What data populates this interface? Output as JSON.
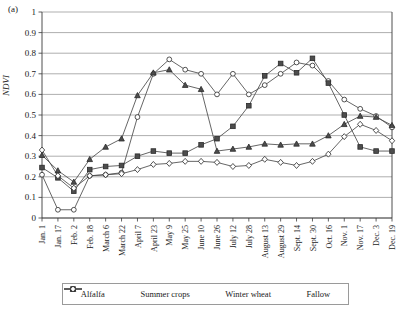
{
  "panel": {
    "label": "(a)"
  },
  "chart_data": {
    "type": "line",
    "title": "",
    "xlabel": "",
    "ylabel": "NDVI",
    "ylim": [
      0,
      1
    ],
    "yticks": [
      0,
      0.1,
      0.2,
      0.3,
      0.4,
      0.5,
      0.6,
      0.7,
      0.8,
      0.9,
      1
    ],
    "ytick_labels": [
      "0",
      "0.1",
      "0.2",
      "0.3",
      "0.4",
      "0.5",
      "0.6",
      "0.7",
      "0.8",
      "0.9",
      "1"
    ],
    "grid": true,
    "legend_position": "bottom",
    "categories": [
      "Jan. 1",
      "Jan. 17",
      "Feb. 2",
      "Feb. 18",
      "March 6",
      "March 22",
      "April 7",
      "April 23",
      "May 9",
      "May 25",
      "June 10",
      "June 26",
      "July 12",
      "July 28",
      "August 13",
      "August 29",
      "Sept. 14",
      "Sept. 30",
      "Oct. 16",
      "Nov. 1",
      "Nov. 17",
      "Dec. 3",
      "Dec. 19"
    ],
    "series": [
      {
        "name": "Alfalfa",
        "marker": "circle",
        "fill": "open",
        "values": [
          0.21,
          0.04,
          0.04,
          0.205,
          0.21,
          0.22,
          0.49,
          0.7,
          0.77,
          0.72,
          0.7,
          0.6,
          0.7,
          0.6,
          0.645,
          0.7,
          0.755,
          0.74,
          0.665,
          0.575,
          0.53,
          0.495,
          0.44
        ]
      },
      {
        "name": "Summer crops",
        "marker": "square",
        "fill": "filled",
        "values": [
          0.245,
          0.195,
          0.13,
          0.235,
          0.25,
          0.255,
          0.3,
          0.325,
          0.315,
          0.315,
          0.355,
          0.385,
          0.445,
          0.545,
          0.69,
          0.75,
          0.705,
          0.775,
          0.655,
          0.5,
          0.345,
          0.325,
          0.325
        ]
      },
      {
        "name": "Winter wheat",
        "marker": "triangle",
        "fill": "filled",
        "values": [
          0.305,
          0.23,
          0.175,
          0.285,
          0.345,
          0.385,
          0.595,
          0.705,
          0.72,
          0.645,
          0.625,
          0.325,
          0.335,
          0.345,
          0.36,
          0.355,
          0.36,
          0.36,
          0.4,
          0.455,
          0.495,
          0.49,
          0.45
        ]
      },
      {
        "name": "Fallow",
        "marker": "diamond",
        "fill": "open",
        "values": [
          0.33,
          0.205,
          0.145,
          0.205,
          0.21,
          0.215,
          0.235,
          0.26,
          0.265,
          0.275,
          0.275,
          0.27,
          0.25,
          0.255,
          0.285,
          0.27,
          0.255,
          0.275,
          0.31,
          0.395,
          0.455,
          0.425,
          0.375
        ]
      }
    ]
  },
  "legend": {
    "entries": [
      {
        "label": "Alfalfa",
        "marker": "circle-open-icon"
      },
      {
        "label": "Summer crops",
        "marker": "square-filled-icon"
      },
      {
        "label": "Winter wheat",
        "marker": "triangle-filled-icon"
      },
      {
        "label": "Fallow",
        "marker": "diamond-open-icon"
      }
    ]
  }
}
